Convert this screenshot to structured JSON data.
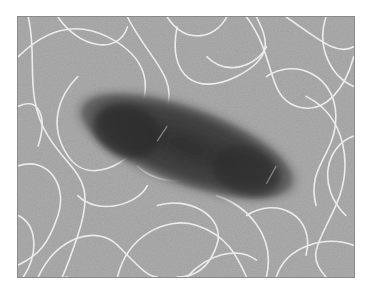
{
  "image": {
    "subject": "electron micrograph of a rod-shaped bacterium with numerous flagella",
    "description": "Dark elongated bacterial cell body lying diagonally across a grainy gray background, surrounded by many thin, white, looping flagella filaments",
    "colors": {
      "background": "#a9a9a9",
      "cell_body": "#3a3a3a",
      "cell_halo": "#6e6e6e",
      "flagella": "#e8e8e8",
      "page": "#ffffff"
    }
  }
}
